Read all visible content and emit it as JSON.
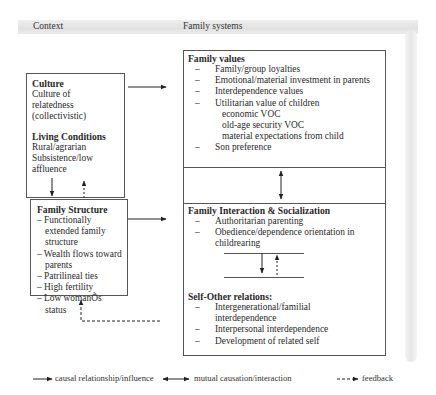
{
  "header": {
    "context_label": "Context",
    "family_systems_label": "Family systems"
  },
  "culture_box": {
    "culture_title": "Culture",
    "culture_lines": [
      "Culture of",
      "relatedness",
      "(collectivistic)"
    ],
    "living_title": "Living Conditions",
    "living_lines": [
      "Rural/agrarian",
      "Subsistence/low",
      "affluence"
    ]
  },
  "family_structure_box": {
    "title": "Family Structure",
    "items": [
      "– Functionally extended family structure",
      "– Wealth flows toward parents",
      "– Patrilineal ties",
      "– High fertility",
      "– Low womanÕs status"
    ]
  },
  "family_values": {
    "title": "Family values",
    "items": [
      {
        "dash": "–",
        "text": "Family/group loyalties"
      },
      {
        "dash": "–",
        "text": "Emotional/material investment in parents"
      },
      {
        "dash": "–",
        "text": "Interdependence values"
      },
      {
        "dash": "–",
        "text": "Utilitarian value of children"
      },
      {
        "dash": "",
        "text": "economic VOC",
        "sub": true
      },
      {
        "dash": "",
        "text": "old-age security VOC",
        "sub": true
      },
      {
        "dash": "",
        "text": "material expectations from child",
        "sub": true
      },
      {
        "dash": "–",
        "text": "Son preference"
      }
    ]
  },
  "family_interaction": {
    "title": "Family Interaction & Socialization",
    "items": [
      {
        "dash": "–",
        "text": "Authoritarian parenting"
      },
      {
        "dash": "–",
        "text": "Obedience/dependence orientation in childrearing"
      }
    ]
  },
  "self_other": {
    "title": "Self-Other relations:",
    "items": [
      {
        "dash": "–",
        "text": "Intergenerational/familial interdependence"
      },
      {
        "dash": "–",
        "text": "Interpersonal interdependence"
      },
      {
        "dash": "–",
        "text": "Development of related self"
      }
    ]
  },
  "legend": {
    "causal": "causal relationship/influence",
    "mutual": "mutual causation/interaction",
    "feedback": "feedback"
  },
  "colors": {
    "line": "#333333",
    "box_border": "#555555",
    "header_band": "#dcdcdc"
  }
}
